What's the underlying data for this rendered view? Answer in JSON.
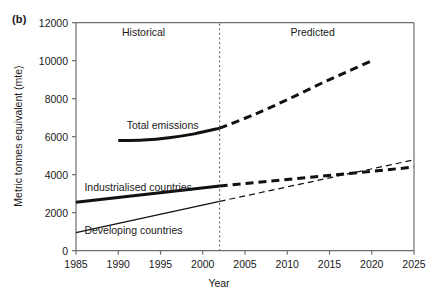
{
  "figure": {
    "panel_label": "(b)",
    "xlabel": "Year",
    "ylabel": "Metric tonnes equivalent (mte)",
    "region_labels": [
      {
        "name": "historical",
        "text": "Historical",
        "x": 1993,
        "y": 11450
      },
      {
        "name": "predicted",
        "text": "Predicted",
        "x": 2013,
        "y": 11450
      }
    ],
    "divider_year": 2002
  },
  "chart_data": {
    "type": "line",
    "title": "",
    "subtitle": "",
    "xlabel": "Year",
    "ylabel": "Metric tonnes equivalent (mte)",
    "xlim": [
      1985,
      2025
    ],
    "ylim": [
      0,
      12000
    ],
    "xticks": [
      1985,
      1990,
      1995,
      2000,
      2005,
      2010,
      2015,
      2020,
      2025
    ],
    "yticks": [
      0,
      2000,
      4000,
      6000,
      8000,
      10000,
      12000
    ],
    "grid": false,
    "legend": "inline-labels",
    "divider": {
      "year": 2002,
      "style": "dotted-vertical",
      "separates": [
        "Historical",
        "Predicted"
      ]
    },
    "series": [
      {
        "name": "Total emissions",
        "label": "Total emissions",
        "label_x": 1991,
        "label_y": 6550,
        "width": "thick",
        "historical": {
          "style": "solid",
          "x": [
            1990,
            1993,
            1996,
            1999,
            2002
          ],
          "y": [
            5800,
            5830,
            5950,
            6150,
            6450
          ]
        },
        "predicted": {
          "style": "dashed",
          "x": [
            2002,
            2006,
            2010,
            2014,
            2017,
            2020
          ],
          "y": [
            6450,
            7150,
            7950,
            8800,
            9400,
            10000
          ]
        }
      },
      {
        "name": "Industrialised countries",
        "label": "Industrialised countries",
        "label_x": 1986,
        "label_y": 3300,
        "width": "thick",
        "historical": {
          "style": "solid",
          "x": [
            1985,
            2002
          ],
          "y": [
            2550,
            3400
          ]
        },
        "predicted": {
          "style": "dashed",
          "x": [
            2002,
            2025
          ],
          "y": [
            3400,
            4400
          ]
        }
      },
      {
        "name": "Developing countries",
        "label": "Developing countries",
        "label_x": 1986,
        "label_y": 1050,
        "width": "thin",
        "historical": {
          "style": "solid",
          "x": [
            1985,
            2002
          ],
          "y": [
            950,
            2600
          ]
        },
        "predicted": {
          "style": "dashed",
          "x": [
            2002,
            2025
          ],
          "y": [
            2600,
            4780
          ]
        }
      }
    ],
    "annotations": [
      {
        "text": "Historical",
        "x": 1993,
        "y": 11450
      },
      {
        "text": "Predicted",
        "x": 2013,
        "y": 11450
      }
    ]
  },
  "colors": {
    "line": "#111111",
    "axis": "#6e6e6e",
    "text": "#1a1a1a",
    "background": "#ffffff"
  }
}
